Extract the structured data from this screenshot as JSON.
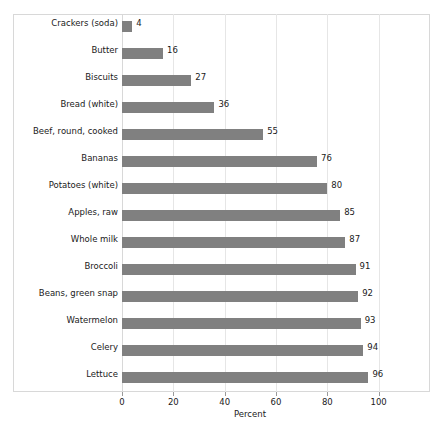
{
  "chart_data": {
    "type": "bar",
    "orientation": "horizontal",
    "title": "",
    "xlabel": "Percent",
    "ylabel": "",
    "xlim": [
      0,
      120
    ],
    "xticks": [
      0,
      20,
      40,
      60,
      80,
      100
    ],
    "grid": true,
    "legend": null,
    "categories": [
      "Crackers (soda)",
      "Butter",
      "Biscuits",
      "Bread (white)",
      "Beef, round, cooked",
      "Bananas",
      "Potatoes (white)",
      "Apples, raw",
      "Whole milk",
      "Broccoli",
      "Beans, green snap",
      "Watermelon",
      "Celery",
      "Lettuce"
    ],
    "values": [
      4,
      16,
      27,
      36,
      55,
      76,
      80,
      85,
      87,
      91,
      92,
      93,
      94,
      96
    ],
    "data_labels": [
      "4",
      "16",
      "27",
      "36",
      "55",
      "76",
      "80",
      "85",
      "87",
      "91",
      "92",
      "93",
      "94",
      "96"
    ],
    "colors": {
      "bar": "#808080",
      "label_panel": "#c4c4c4",
      "gridline": "#e6e6e6",
      "frame": "#d8d8d8",
      "text": "#1a1a1a",
      "background": "#ffffff"
    }
  }
}
